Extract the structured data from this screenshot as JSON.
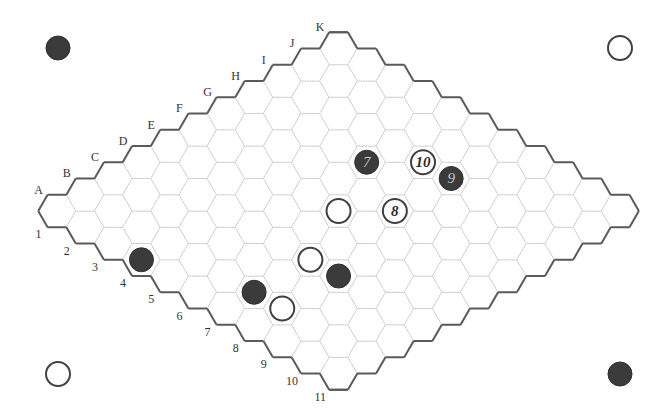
{
  "game": {
    "name": "Hex",
    "board_size": 11,
    "letters": [
      "A",
      "B",
      "C",
      "D",
      "E",
      "F",
      "G",
      "H",
      "I",
      "J",
      "K"
    ],
    "numbers": [
      "1",
      "2",
      "3",
      "4",
      "5",
      "6",
      "7",
      "8",
      "9",
      "10",
      "11"
    ]
  },
  "colors": {
    "black_stone": "#3b3b3b",
    "white_stone_ring": "#404040",
    "board_edge": "#5a5a5a",
    "grid_line": "#c4c4c4"
  },
  "corner_markers": [
    {
      "position": "top-left",
      "color": "black"
    },
    {
      "position": "top-right",
      "color": "white"
    },
    {
      "position": "bottom-left",
      "color": "white"
    },
    {
      "position": "bottom-right",
      "color": "black"
    }
  ],
  "stones": [
    {
      "cell": "H5",
      "color": "black",
      "label": "7"
    },
    {
      "cell": "I6",
      "color": "white",
      "label": "10"
    },
    {
      "cell": "I7",
      "color": "black",
      "label": "9"
    },
    {
      "cell": "F6",
      "color": "white",
      "label": ""
    },
    {
      "cell": "G7",
      "color": "white",
      "label": "8"
    },
    {
      "cell": "D7",
      "color": "white",
      "label": ""
    },
    {
      "cell": "D8",
      "color": "black",
      "label": ""
    },
    {
      "cell": "B7",
      "color": "black",
      "label": ""
    },
    {
      "cell": "B8",
      "color": "white",
      "label": ""
    },
    {
      "cell": "A4",
      "color": "black",
      "label": ""
    }
  ]
}
